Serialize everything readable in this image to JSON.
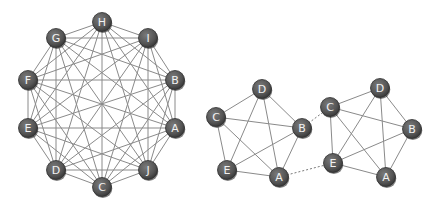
{
  "diagram": {
    "complete_graph": {
      "nodes": [
        {
          "id": "H",
          "x": 102,
          "y": 22
        },
        {
          "id": "I",
          "x": 148,
          "y": 38
        },
        {
          "id": "B",
          "x": 175,
          "y": 80
        },
        {
          "id": "A",
          "x": 175,
          "y": 128
        },
        {
          "id": "J",
          "x": 148,
          "y": 170
        },
        {
          "id": "C",
          "x": 102,
          "y": 187
        },
        {
          "id": "D",
          "x": 56,
          "y": 170
        },
        {
          "id": "E",
          "x": 28,
          "y": 128
        },
        {
          "id": "F",
          "x": 28,
          "y": 80
        },
        {
          "id": "G",
          "x": 56,
          "y": 38
        }
      ]
    },
    "pentagon_left": {
      "nodes": [
        {
          "id": "D",
          "x": 262,
          "y": 89
        },
        {
          "id": "C",
          "x": 216,
          "y": 117
        },
        {
          "id": "B",
          "x": 302,
          "y": 128
        },
        {
          "id": "E",
          "x": 227,
          "y": 170
        },
        {
          "id": "A",
          "x": 279,
          "y": 177
        }
      ]
    },
    "pentagon_right": {
      "nodes": [
        {
          "id": "D",
          "x": 380,
          "y": 88
        },
        {
          "id": "C",
          "x": 330,
          "y": 107
        },
        {
          "id": "B",
          "x": 412,
          "y": 129
        },
        {
          "id": "E",
          "x": 333,
          "y": 163
        },
        {
          "id": "A",
          "x": 386,
          "y": 177
        }
      ]
    },
    "bridges": [
      {
        "from": "pentagon_left.B",
        "to": "pentagon_right.C",
        "style": "dashed"
      },
      {
        "from": "pentagon_left.A",
        "to": "pentagon_right.E",
        "style": "dashed"
      }
    ],
    "colors": {
      "node_fill": "#5c5c5c",
      "node_label": "#f2f2f2",
      "edge": "#8a8a8a",
      "background": "#ffffff"
    }
  }
}
